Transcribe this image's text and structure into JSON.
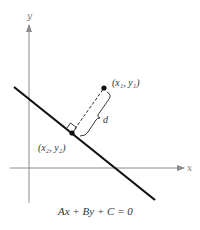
{
  "diagram": {
    "axes": {
      "x_label": "x",
      "y_label": "y",
      "axis_color": "#8a8a8a"
    },
    "line": {
      "equation": "Ax + By + C = 0",
      "color": "#111111"
    },
    "points": {
      "p1_label": "(x₁, y₁)",
      "p2_label": "(x₂, y₂)"
    },
    "distance_label": "d"
  }
}
